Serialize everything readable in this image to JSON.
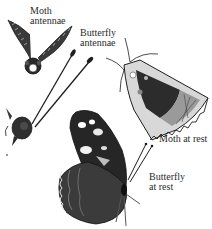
{
  "figure": {
    "labels": {
      "moth_antennae": [
        "Moth",
        "antennae"
      ],
      "butterfly_antennae": [
        "Butterfly",
        "antennae"
      ],
      "moth_at_rest": [
        "Moth at rest"
      ],
      "butterfly_at_rest": [
        "Butterfly",
        "at rest"
      ]
    },
    "illustrations": [
      "moth-head-feathered-antennae",
      "butterfly-head-clubbed-antennae",
      "moth-at-rest",
      "butterfly-at-rest"
    ],
    "colors": {
      "ink": "#1e1e1e",
      "paper": "#ffffff"
    }
  }
}
